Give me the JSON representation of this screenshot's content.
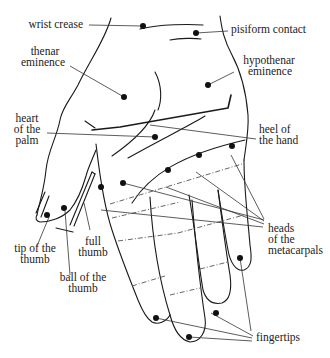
{
  "diagram": {
    "colors": {
      "line": "#1a1a1a",
      "dot": "#111111",
      "text": "#222222",
      "background": "#ffffff"
    },
    "labels": {
      "wrist_crease": "wrist crease",
      "pisiform_contact": "pisiform contact",
      "thenar_1": "thenar",
      "thenar_2": "eminence",
      "hypothenar_1": "hypothenar",
      "hypothenar_2": "eminence",
      "heart_1": "heart",
      "heart_2": "of the",
      "heart_3": "palm",
      "heel_1": "heel of",
      "heel_2": "the hand",
      "heads_1": "heads",
      "heads_2": "of the",
      "heads_3": "metacarpals",
      "full_thumb_1": "full",
      "full_thumb_2": "thumb",
      "tip_thumb_1": "tip of the",
      "tip_thumb_2": "thumb",
      "ball_thumb_1": "ball of the",
      "ball_thumb_2": "thumb",
      "fingertips": "fingertips"
    }
  }
}
